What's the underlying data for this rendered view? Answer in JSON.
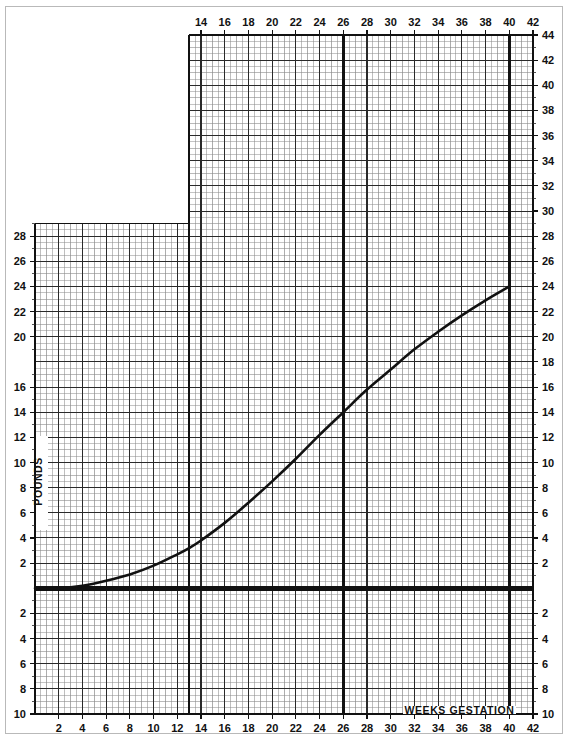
{
  "page": {
    "background_color": "#ffffff",
    "border_color": "#b9b9b9"
  },
  "chart_data": {
    "type": "line",
    "title": "",
    "xlabel": "WEEKS GESTATION",
    "ylabel": "POUNDS",
    "xlim": [
      0,
      42
    ],
    "ylim": [
      -10,
      44
    ],
    "grid": true,
    "legend": null,
    "axis_colors": {
      "grid_minor": "#8a8a8a",
      "grid_major": "#2a2a2a",
      "grid_heavy": "#111111",
      "curve": "#111111",
      "zero_line": "#111111"
    },
    "x_axis_bottom_ticks": [
      2,
      4,
      6,
      8,
      10,
      12,
      14,
      16,
      18,
      20,
      22,
      24,
      26,
      28,
      30,
      32,
      34,
      36,
      38,
      40,
      42
    ],
    "x_axis_top_ticks": [
      14,
      16,
      18,
      20,
      22,
      24,
      26,
      28,
      30,
      32,
      34,
      36,
      38,
      40,
      42
    ],
    "y_axis_left_ticks": [
      28,
      26,
      24,
      22,
      20,
      16,
      14,
      12,
      10,
      8,
      6,
      4,
      2,
      2,
      4,
      6,
      8,
      10
    ],
    "y_axis_left_values": [
      28,
      26,
      24,
      22,
      20,
      16,
      14,
      12,
      10,
      8,
      6,
      4,
      2,
      -2,
      -4,
      -6,
      -8,
      -10
    ],
    "y_axis_right_ticks": [
      44,
      42,
      40,
      38,
      36,
      34,
      32,
      30,
      28,
      26,
      24,
      22,
      20,
      18,
      16,
      14,
      12,
      10,
      8,
      6,
      4,
      2,
      2,
      4,
      6,
      8,
      10
    ],
    "y_axis_right_values": [
      44,
      42,
      40,
      38,
      36,
      34,
      32,
      30,
      28,
      26,
      24,
      22,
      20,
      18,
      16,
      14,
      12,
      10,
      8,
      6,
      4,
      2,
      -2,
      -4,
      -6,
      -8,
      -10
    ],
    "zero_line_value": 0,
    "trimester_markers": [
      13,
      26,
      40
    ],
    "lower_panel_top_value": 29,
    "upper_panel_start_week": 13,
    "series": [
      {
        "name": "Average prenatal weight gain",
        "x": [
          0,
          2,
          4,
          6,
          8,
          10,
          12,
          13,
          14,
          16,
          18,
          20,
          22,
          24,
          26,
          28,
          30,
          32,
          34,
          36,
          38,
          40
        ],
        "values": [
          0,
          0,
          0.2,
          0.6,
          1.1,
          1.8,
          2.7,
          3.2,
          3.8,
          5.2,
          6.8,
          8.5,
          10.3,
          12.2,
          14.0,
          15.8,
          17.4,
          19.0,
          20.4,
          21.7,
          22.9,
          24.0
        ]
      }
    ],
    "annotations": [
      {
        "text": "WEEKS GESTATION",
        "x": 36,
        "y": -10,
        "position": "bottom-right-inside-grid"
      },
      {
        "text": "POUNDS",
        "x": 0.5,
        "y": 9,
        "rotation": -90,
        "position": "left-inside-grid"
      }
    ]
  }
}
